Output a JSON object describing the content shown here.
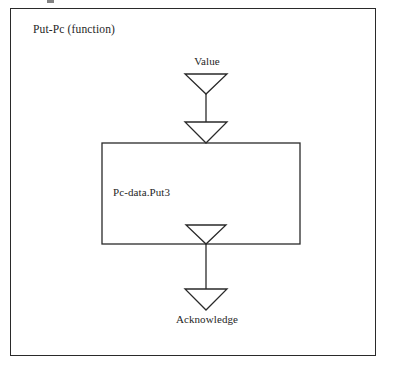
{
  "page": {
    "width": 408,
    "height": 386,
    "background_color": "#ffffff",
    "ink_color": "#2a2a2a"
  },
  "diagram": {
    "title": "Put-Pc (function)",
    "type": "dataflow-function-diagram",
    "frame": {
      "x": 10,
      "y": 8,
      "width": 366,
      "height": 348
    },
    "process_box": {
      "label": "Pc-data.Put3",
      "x": 102,
      "y": 143,
      "width": 198,
      "height": 101
    },
    "signals": [
      {
        "name": "input-signal",
        "label": "Value",
        "direction": "down",
        "label_position": "top"
      },
      {
        "name": "output-signal",
        "label": "Acknowledge",
        "direction": "down",
        "label_position": "bottom"
      }
    ],
    "arrows": [
      {
        "name": "value-arrow-upper",
        "x": 206,
        "y": 74,
        "width": 42,
        "height": 21,
        "direction": "down"
      },
      {
        "name": "value-arrow-lower",
        "x": 206,
        "y": 122,
        "width": 42,
        "height": 21,
        "direction": "down"
      },
      {
        "name": "acknowledge-arrow-upper",
        "x": 206,
        "y": 224,
        "width": 42,
        "height": 20,
        "direction": "down"
      },
      {
        "name": "acknowledge-arrow-lower",
        "x": 206,
        "y": 289,
        "width": 42,
        "height": 21,
        "direction": "down"
      }
    ],
    "connectors": [
      {
        "name": "value-connector",
        "x": 206,
        "y1": 94,
        "y2": 122
      },
      {
        "name": "acknowledge-connector",
        "x": 206,
        "y1": 244,
        "y2": 289
      }
    ]
  }
}
